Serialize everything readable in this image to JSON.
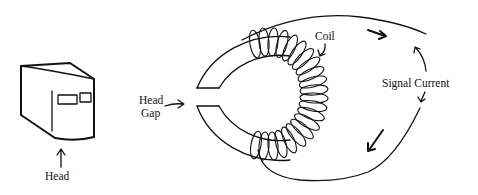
{
  "diagram": {
    "labels": {
      "head": "Head",
      "head_gap_line1": "Head",
      "head_gap_line2": "Gap",
      "coil": "Coil",
      "signal_current": "Signal Current"
    },
    "components": [
      {
        "name": "head",
        "description": "3D block drawing of recording head with two windows"
      },
      {
        "name": "toroid-core",
        "description": "C-shaped ring core with a gap on the left"
      },
      {
        "name": "coil-winding",
        "description": "Wire wound around the right half of the core"
      },
      {
        "name": "signal-loop",
        "description": "Wire loop carrying signal current with direction arrows"
      }
    ],
    "colors": {
      "ink": "#111111",
      "background": "#ffffff"
    }
  }
}
